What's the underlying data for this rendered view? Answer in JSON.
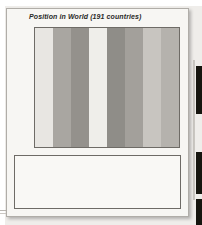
{
  "figure": {
    "title": "Position in World (191 countries)",
    "axis": {
      "ticks": [
        "1st",
        "50th",
        "100th",
        "150th",
        "191st"
      ],
      "tick_values": [
        1,
        50,
        100,
        150,
        191
      ]
    }
  },
  "chart_data": {
    "type": "bar",
    "title": "Position in World (191 countries)",
    "xlabel": "",
    "ylabel": "Position in World",
    "ylim": [
      1,
      191
    ],
    "y_inverted": true,
    "grid": true,
    "legend_position": "bottom",
    "tick_labels": [
      "1st",
      "50th",
      "100th",
      "150th",
      "191st"
    ],
    "categories": [
      "Life expectancy",
      "Infant mortality",
      "GDP per capita",
      "Daily calorie intake",
      "Literacy",
      "Schooling index",
      "Educational rank",
      "Human dev. index"
    ],
    "values": [
      166,
      162,
      149,
      107,
      144,
      129,
      145,
      158
    ],
    "band_colors": [
      "#e8e6e2",
      "#a9a6a1",
      "#94918c",
      "#efeeea",
      "#8f8d88",
      "#a3a09b",
      "#c8c5c0",
      "#b5b2ad"
    ],
    "marker": "person-pictogram"
  },
  "legend": {
    "left": [
      {
        "label": "Life expectancy",
        "color": "#e8e6e2"
      },
      {
        "label": "Infant mortality",
        "color": "#a9a6a1"
      },
      {
        "label": "GDP per capita",
        "color": "#94918c"
      },
      {
        "label": "Daily calorie intake",
        "color": "#efeeea"
      }
    ],
    "right": [
      {
        "label": "Literacy",
        "color": "#8f8d88"
      },
      {
        "label": "Schooling index",
        "color": "#a3a09b"
      },
      {
        "label": "Educational rank",
        "color": "#c8c5c0"
      },
      {
        "label": "Human dev. index",
        "color": "#b5b2ad"
      }
    ]
  }
}
